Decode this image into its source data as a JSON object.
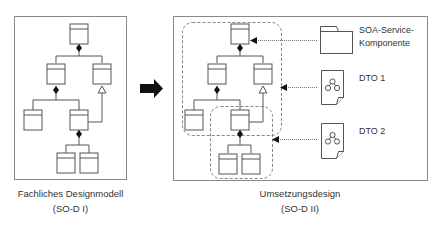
{
  "colors": {
    "stroke": "#555555",
    "panel_border": "#888888",
    "dashed": "#777777",
    "arrow_fill": "#111111",
    "text": "#333333",
    "background": "#ffffff"
  },
  "left_panel": {
    "caption_line1": "Fachliches Designmodell",
    "caption_line2": "(SO-D I)"
  },
  "transition_arrow": {
    "icon": "right-arrow-icon"
  },
  "right_panel": {
    "caption_line1": "Umsetzungsdesign",
    "caption_line2": "(SO-D II)",
    "legend": [
      {
        "icon": "folder-icon",
        "label_line1": "SOA-Service-",
        "label_line2": "Komponente"
      },
      {
        "icon": "document-icon",
        "label_line1": "DTO 1",
        "label_line2": ""
      },
      {
        "icon": "document-icon",
        "label_line1": "DTO 2",
        "label_line2": ""
      }
    ]
  }
}
